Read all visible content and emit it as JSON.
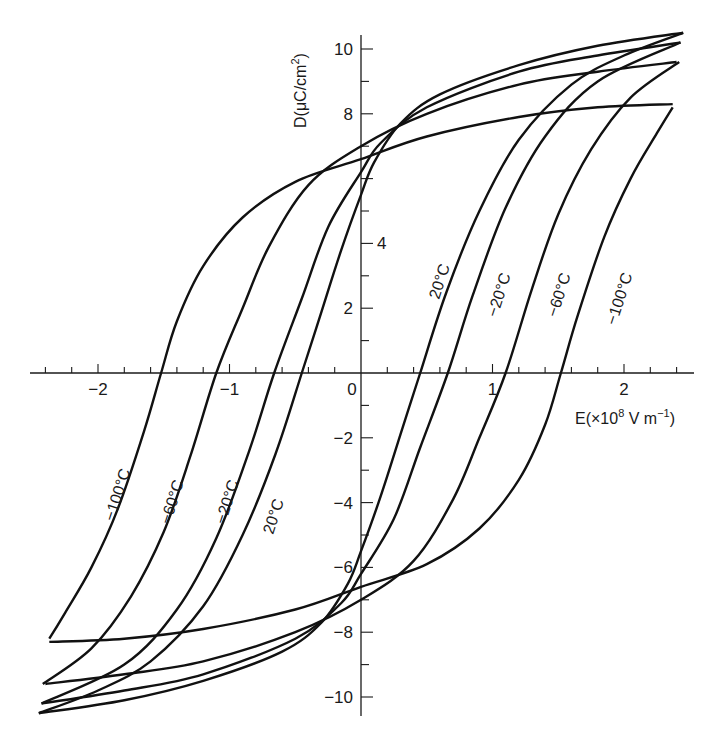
{
  "chart_data": {
    "type": "line",
    "title": "",
    "xlabel": "E(×10⁸ V m⁻¹)",
    "ylabel": "D(μC/cm²)",
    "xlim": [
      -2.5,
      2.5
    ],
    "ylim": [
      -10.8,
      10.6
    ],
    "grid": false,
    "legend": "none (curves labelled inline)",
    "x_ticks": [
      -2,
      -1,
      0,
      1,
      2
    ],
    "x_minor_step": 0.2,
    "y_ticks": [
      -10,
      -8,
      -6,
      -4,
      -2,
      2,
      4,
      8,
      10
    ],
    "y_minor_step": 1,
    "series": [
      {
        "name": "−100°C",
        "tip": [
          2.37,
          8.3
        ],
        "coercive_field": 1.55,
        "upper_branch": [
          [
            2.37,
            8.3
          ],
          [
            1.8,
            8.2
          ],
          [
            1.2,
            7.9
          ],
          [
            0.5,
            7.3
          ],
          [
            0,
            6.6
          ],
          [
            -0.5,
            5.9
          ],
          [
            -0.9,
            4.8
          ],
          [
            -1.2,
            3.3
          ],
          [
            -1.4,
            1.6
          ],
          [
            -1.52,
            0
          ],
          [
            -1.65,
            -1.8
          ],
          [
            -1.85,
            -4.2
          ],
          [
            -2.05,
            -6.0
          ],
          [
            -2.25,
            -7.4
          ],
          [
            -2.37,
            -8.2
          ]
        ]
      },
      {
        "name": "−60°C",
        "tip": [
          2.4,
          9.6
        ],
        "coercive_field": 1.15,
        "upper_branch": [
          [
            2.4,
            9.6
          ],
          [
            1.8,
            9.3
          ],
          [
            1.2,
            8.9
          ],
          [
            0.5,
            8.0
          ],
          [
            0,
            7.0
          ],
          [
            -0.4,
            5.8
          ],
          [
            -0.7,
            3.9
          ],
          [
            -0.9,
            2.0
          ],
          [
            -1.1,
            0
          ],
          [
            -1.3,
            -2.6
          ],
          [
            -1.5,
            -4.9
          ],
          [
            -1.75,
            -6.9
          ],
          [
            -2.05,
            -8.5
          ],
          [
            -2.42,
            -9.6
          ]
        ]
      },
      {
        "name": "−20°C",
        "tip": [
          2.43,
          10.2
        ],
        "coercive_field": 0.7,
        "upper_branch": [
          [
            2.43,
            10.2
          ],
          [
            1.8,
            9.8
          ],
          [
            1.2,
            9.3
          ],
          [
            0.5,
            8.2
          ],
          [
            0.15,
            7.1
          ],
          [
            0,
            6.2
          ],
          [
            -0.25,
            4.5
          ],
          [
            -0.45,
            2.3
          ],
          [
            -0.66,
            0
          ],
          [
            -0.85,
            -2.4
          ],
          [
            -1.1,
            -5.1
          ],
          [
            -1.4,
            -7.3
          ],
          [
            -1.8,
            -9.0
          ],
          [
            -2.43,
            -10.2
          ]
        ]
      },
      {
        "name": "20°C",
        "tip": [
          2.45,
          10.5
        ],
        "coercive_field": 0.5,
        "upper_branch": [
          [
            2.45,
            10.5
          ],
          [
            1.8,
            10.1
          ],
          [
            1.2,
            9.5
          ],
          [
            0.6,
            8.6
          ],
          [
            0.3,
            7.7
          ],
          [
            0.1,
            6.5
          ],
          [
            0,
            5.5
          ],
          [
            -0.15,
            3.8
          ],
          [
            -0.3,
            1.9
          ],
          [
            -0.45,
            0
          ],
          [
            -0.65,
            -2.5
          ],
          [
            -0.9,
            -5.0
          ],
          [
            -1.2,
            -7.2
          ],
          [
            -1.6,
            -8.9
          ],
          [
            -2.0,
            -9.8
          ],
          [
            -2.45,
            -10.5
          ]
        ]
      }
    ],
    "note": "Lower (ascending) branches are the point reflection of the upper branches through the origin."
  },
  "axes": {
    "x_label_main": "E(×10",
    "x_label_exp": "8",
    "x_label_unit": " V m",
    "x_label_unit_exp": "−1",
    "x_label_close": ")",
    "y_label_main": "D(μC/cm",
    "y_label_exp": "2",
    "y_label_close": ")",
    "x_tick_labels": [
      "−2",
      "−1",
      "0",
      "1",
      "2"
    ],
    "y_tick_labels": {
      "10": "10",
      "8": "8",
      "4": "4",
      "2": "2",
      "-2": "−2",
      "-4": "−4",
      "-6": "−6",
      "-8": "−8",
      "-10": "−10"
    }
  },
  "labels": {
    "upper_right": [
      "20°C",
      "−20°C",
      "−60°C",
      "−100°C"
    ],
    "lower_left": [
      "−100°C",
      "−60°C",
      "−20°C",
      "20°C"
    ]
  }
}
